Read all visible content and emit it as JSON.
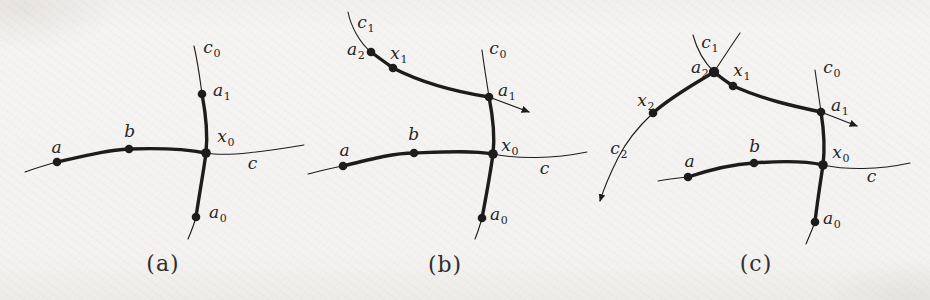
{
  "page": {
    "background_color": "#f5f3f1",
    "ink_color": "#1c1c1c",
    "label_color": "#252525"
  },
  "figures": [
    {
      "id": "a",
      "caption": "(a)",
      "points": [
        "a",
        "b",
        "x0",
        "a1",
        "a0"
      ],
      "labels": {
        "a": {
          "base": "a",
          "sub": ""
        },
        "b": {
          "base": "b",
          "sub": ""
        },
        "x0": {
          "base": "x",
          "sub": "0"
        },
        "a1": {
          "base": "a",
          "sub": "1"
        },
        "a0": {
          "base": "a",
          "sub": "0"
        },
        "c": {
          "base": "c",
          "sub": ""
        },
        "c0": {
          "base": "c",
          "sub": "0"
        }
      }
    },
    {
      "id": "b",
      "caption": "(b)",
      "points": [
        "a",
        "b",
        "x0",
        "a1",
        "a0",
        "a2",
        "x1"
      ],
      "labels": {
        "a": {
          "base": "a",
          "sub": ""
        },
        "b": {
          "base": "b",
          "sub": ""
        },
        "x0": {
          "base": "x",
          "sub": "0"
        },
        "a1": {
          "base": "a",
          "sub": "1"
        },
        "a0": {
          "base": "a",
          "sub": "0"
        },
        "c": {
          "base": "c",
          "sub": ""
        },
        "c0": {
          "base": "c",
          "sub": "0"
        },
        "a2": {
          "base": "a",
          "sub": "2"
        },
        "x1": {
          "base": "x",
          "sub": "1"
        },
        "c1": {
          "base": "c",
          "sub": "1"
        }
      }
    },
    {
      "id": "c",
      "caption": "(c)",
      "points": [
        "a",
        "b",
        "x0",
        "a1",
        "a0",
        "a2",
        "x1",
        "x2"
      ],
      "labels": {
        "a": {
          "base": "a",
          "sub": ""
        },
        "b": {
          "base": "b",
          "sub": ""
        },
        "x0": {
          "base": "x",
          "sub": "0"
        },
        "a1": {
          "base": "a",
          "sub": "1"
        },
        "a0": {
          "base": "a",
          "sub": "0"
        },
        "c": {
          "base": "c",
          "sub": ""
        },
        "c0": {
          "base": "c",
          "sub": "0"
        },
        "a2": {
          "base": "a",
          "sub": "2"
        },
        "x1": {
          "base": "x",
          "sub": "1"
        },
        "c1": {
          "base": "c",
          "sub": "1"
        },
        "x2": {
          "base": "x",
          "sub": "2"
        },
        "c2": {
          "base": "c",
          "sub": "2"
        }
      }
    }
  ]
}
